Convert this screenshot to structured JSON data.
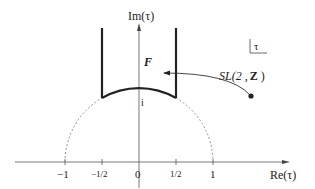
{
  "diagram": {
    "axes": {
      "x_label": "Re(τ)",
      "y_label": "Im(τ)"
    },
    "ticks": [
      {
        "value": -1,
        "label": "−1"
      },
      {
        "value": -0.5,
        "label": "−1/2"
      },
      {
        "value": 0,
        "label": "0"
      },
      {
        "value": 0.5,
        "label": "1/2"
      },
      {
        "value": 1,
        "label": "1"
      }
    ],
    "region_label": "F",
    "point_label": "i",
    "group_label": "SL(2 ,",
    "group_label_z": "Z",
    "group_label_close": ")",
    "plane_label": "τ",
    "colors": {
      "ink": "#222222",
      "dashed": "#888888"
    }
  }
}
